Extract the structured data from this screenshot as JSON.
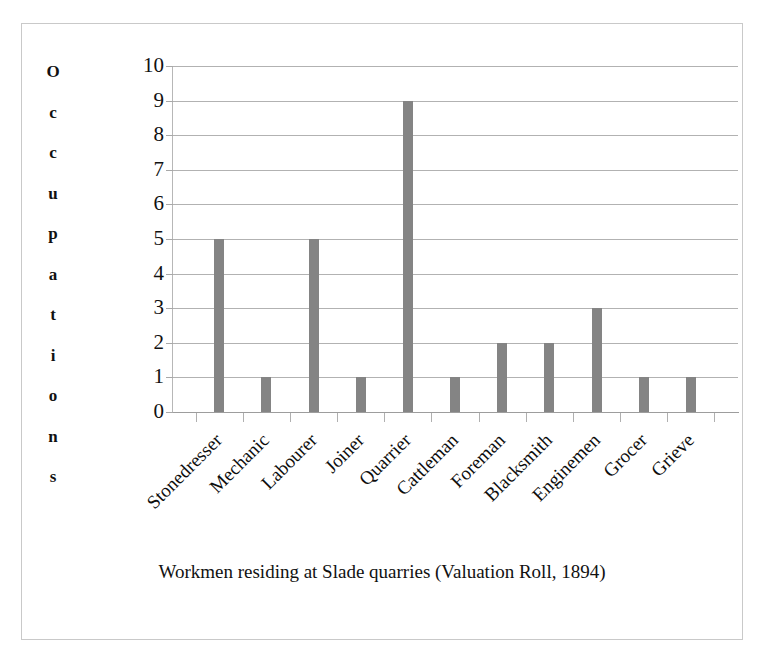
{
  "figure": {
    "caption": "Workmen residing at Slade quarries (Valuation Roll, 1894)",
    "y_axis_title": "Occupations",
    "y_axis_title_letters": [
      "O",
      "c",
      "c",
      "u",
      "p",
      "a",
      "t",
      "i",
      "o",
      "n",
      "s"
    ],
    "border_color": "#c9c9c9",
    "bar_color": "#848484",
    "gridline_color": "#b2b2b2"
  },
  "chart_data": {
    "type": "bar",
    "title": "Workmen residing at Slade quarries (Valuation Roll, 1894)",
    "xlabel": "",
    "ylabel": "Occupations",
    "categories": [
      "Stonedresser",
      "Mechanic",
      "Labourer",
      "Joiner",
      "Quarrier",
      "Cattleman",
      "Foreman",
      "Blacksmith",
      "Enginemen",
      "Grocer",
      "Grieve"
    ],
    "values": [
      5,
      1,
      5,
      1,
      9,
      1,
      2,
      2,
      3,
      1,
      1
    ],
    "ylim": [
      0,
      10
    ],
    "ytick_labels": [
      "10",
      "9",
      "8",
      "7",
      "6",
      "5",
      "4",
      "3",
      "2",
      "1",
      "0"
    ],
    "ytick_values": [
      10,
      9,
      8,
      7,
      6,
      5,
      4,
      3,
      2,
      1,
      0
    ],
    "grid": true,
    "legend": false,
    "bar_color": "#848484"
  }
}
